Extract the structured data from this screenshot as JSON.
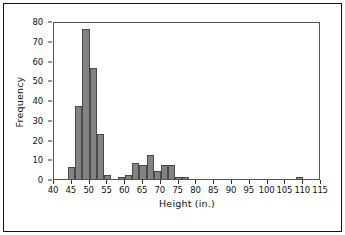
{
  "chart_data": {
    "type": "bar",
    "title": "",
    "xlabel": "Height (in.)",
    "ylabel": "Frequency",
    "xlim": [
      40,
      115
    ],
    "ylim": [
      0,
      80
    ],
    "bin_width": 2,
    "grid": false,
    "legend": null,
    "bar_color": "#838383",
    "bar_edge_color": "#4a4a4a",
    "xticks": [
      40,
      45,
      50,
      55,
      60,
      65,
      70,
      75,
      80,
      85,
      90,
      95,
      100,
      105,
      110,
      115
    ],
    "yticks": [
      0,
      10,
      20,
      30,
      40,
      50,
      60,
      70,
      80
    ],
    "bins": [
      {
        "start": 44,
        "end": 46,
        "value": 6
      },
      {
        "start": 46,
        "end": 48,
        "value": 37
      },
      {
        "start": 48,
        "end": 50,
        "value": 76
      },
      {
        "start": 50,
        "end": 52,
        "value": 56
      },
      {
        "start": 52,
        "end": 54,
        "value": 23
      },
      {
        "start": 54,
        "end": 56,
        "value": 2
      },
      {
        "start": 58,
        "end": 60,
        "value": 1
      },
      {
        "start": 60,
        "end": 62,
        "value": 2
      },
      {
        "start": 62,
        "end": 64,
        "value": 8
      },
      {
        "start": 64,
        "end": 66,
        "value": 7
      },
      {
        "start": 66,
        "end": 68,
        "value": 12
      },
      {
        "start": 68,
        "end": 70,
        "value": 4
      },
      {
        "start": 70,
        "end": 72,
        "value": 7
      },
      {
        "start": 72,
        "end": 74,
        "value": 7
      },
      {
        "start": 74,
        "end": 76,
        "value": 1
      },
      {
        "start": 76,
        "end": 78,
        "value": 1
      },
      {
        "start": 108,
        "end": 110,
        "value": 1
      }
    ]
  }
}
